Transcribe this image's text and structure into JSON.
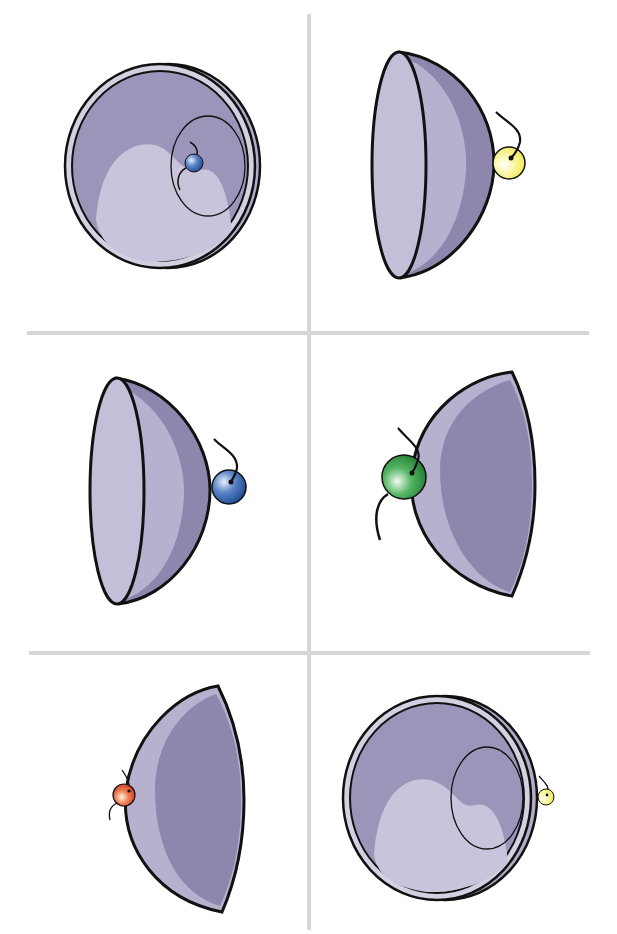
{
  "figure": {
    "layout": "3 rows x 2 columns grid of illustrations separated by light grey lines",
    "divider_color": "#d6d8d8",
    "colors": {
      "outline": "#111111",
      "hemisphere_light": "#c4bfd8",
      "hemisphere_mid": "#a8a1c2",
      "hemisphere_dark": "#8e86ad",
      "ball_blue": "#2f5fae",
      "ball_yellow": "#f4f07a",
      "ball_green": "#2f9a47",
      "ball_red": "#d9452a"
    },
    "panels": [
      {
        "row": 1,
        "col": 1,
        "view": "open-face hemisphere with inner circle",
        "ball_color": "blue",
        "ball_position": "inside cup"
      },
      {
        "row": 1,
        "col": 2,
        "view": "side-view hemisphere, opening left",
        "ball_color": "yellow",
        "ball_position": "right outer surface"
      },
      {
        "row": 2,
        "col": 1,
        "view": "side-view hemisphere, opening left",
        "ball_color": "blue",
        "ball_position": "right outer surface"
      },
      {
        "row": 2,
        "col": 2,
        "view": "back-view hemisphere, dome left",
        "ball_color": "green",
        "ball_position": "left outer surface"
      },
      {
        "row": 3,
        "col": 1,
        "view": "back-view hemisphere, dome left",
        "ball_color": "red",
        "ball_position": "left outer surface"
      },
      {
        "row": 3,
        "col": 2,
        "view": "open-face hemisphere with inner circle",
        "ball_color": "yellow",
        "ball_position": "right outer edge"
      }
    ]
  }
}
